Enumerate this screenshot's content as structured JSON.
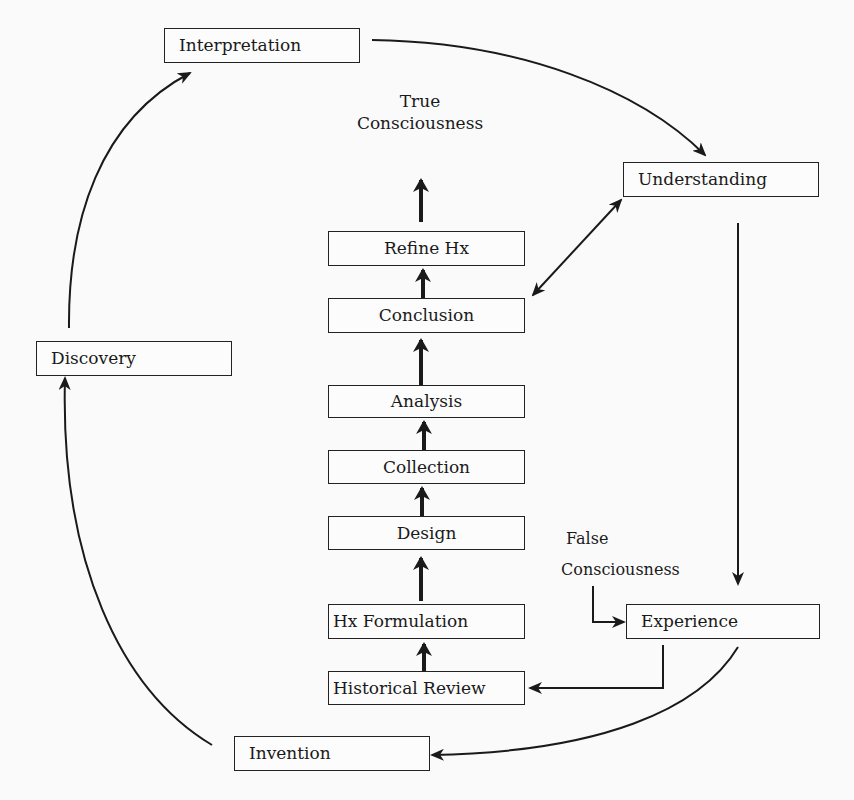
{
  "diagram": {
    "outer_cycle": {
      "interpretation": "Interpretation",
      "understanding": "Understanding",
      "experience": "Experience",
      "invention": "Invention",
      "discovery": "Discovery"
    },
    "research_steps": {
      "refine_hx": "Refine Hx",
      "conclusion": "Conclusion",
      "analysis": "Analysis",
      "collection": "Collection",
      "design": "Design",
      "hx_formulation": "Hx Formulation",
      "historical_review": "Historical Review"
    },
    "labels": {
      "true_consciousness_line1": "True",
      "true_consciousness_line2": "Consciousness",
      "false_consciousness_line1": "False",
      "false_consciousness_line2": "Consciousness"
    },
    "connections": [
      {
        "from": "Interpretation",
        "to": "Understanding",
        "style": "curved"
      },
      {
        "from": "Understanding",
        "to": "Experience",
        "style": "straight"
      },
      {
        "from": "Experience",
        "to": "Invention",
        "style": "curved"
      },
      {
        "from": "Experience",
        "to": "Historical Review",
        "style": "elbow"
      },
      {
        "from": "Invention",
        "to": "Discovery",
        "style": "curved"
      },
      {
        "from": "Discovery",
        "to": "Interpretation",
        "style": "curved"
      },
      {
        "from": "Understanding",
        "to": "Conclusion",
        "style": "bidirectional"
      },
      {
        "from": "False Consciousness",
        "to": "Experience",
        "style": "elbow"
      },
      {
        "from": "Historical Review",
        "to": "Hx Formulation",
        "style": "bold-up"
      },
      {
        "from": "Hx Formulation",
        "to": "Design",
        "style": "bold-up"
      },
      {
        "from": "Design",
        "to": "Collection",
        "style": "bold-up"
      },
      {
        "from": "Collection",
        "to": "Analysis",
        "style": "bold-up"
      },
      {
        "from": "Analysis",
        "to": "Conclusion",
        "style": "bold-up"
      },
      {
        "from": "Conclusion",
        "to": "Refine Hx",
        "style": "bold-up"
      },
      {
        "from": "Refine Hx",
        "to": "True Consciousness",
        "style": "bold-up"
      }
    ]
  }
}
